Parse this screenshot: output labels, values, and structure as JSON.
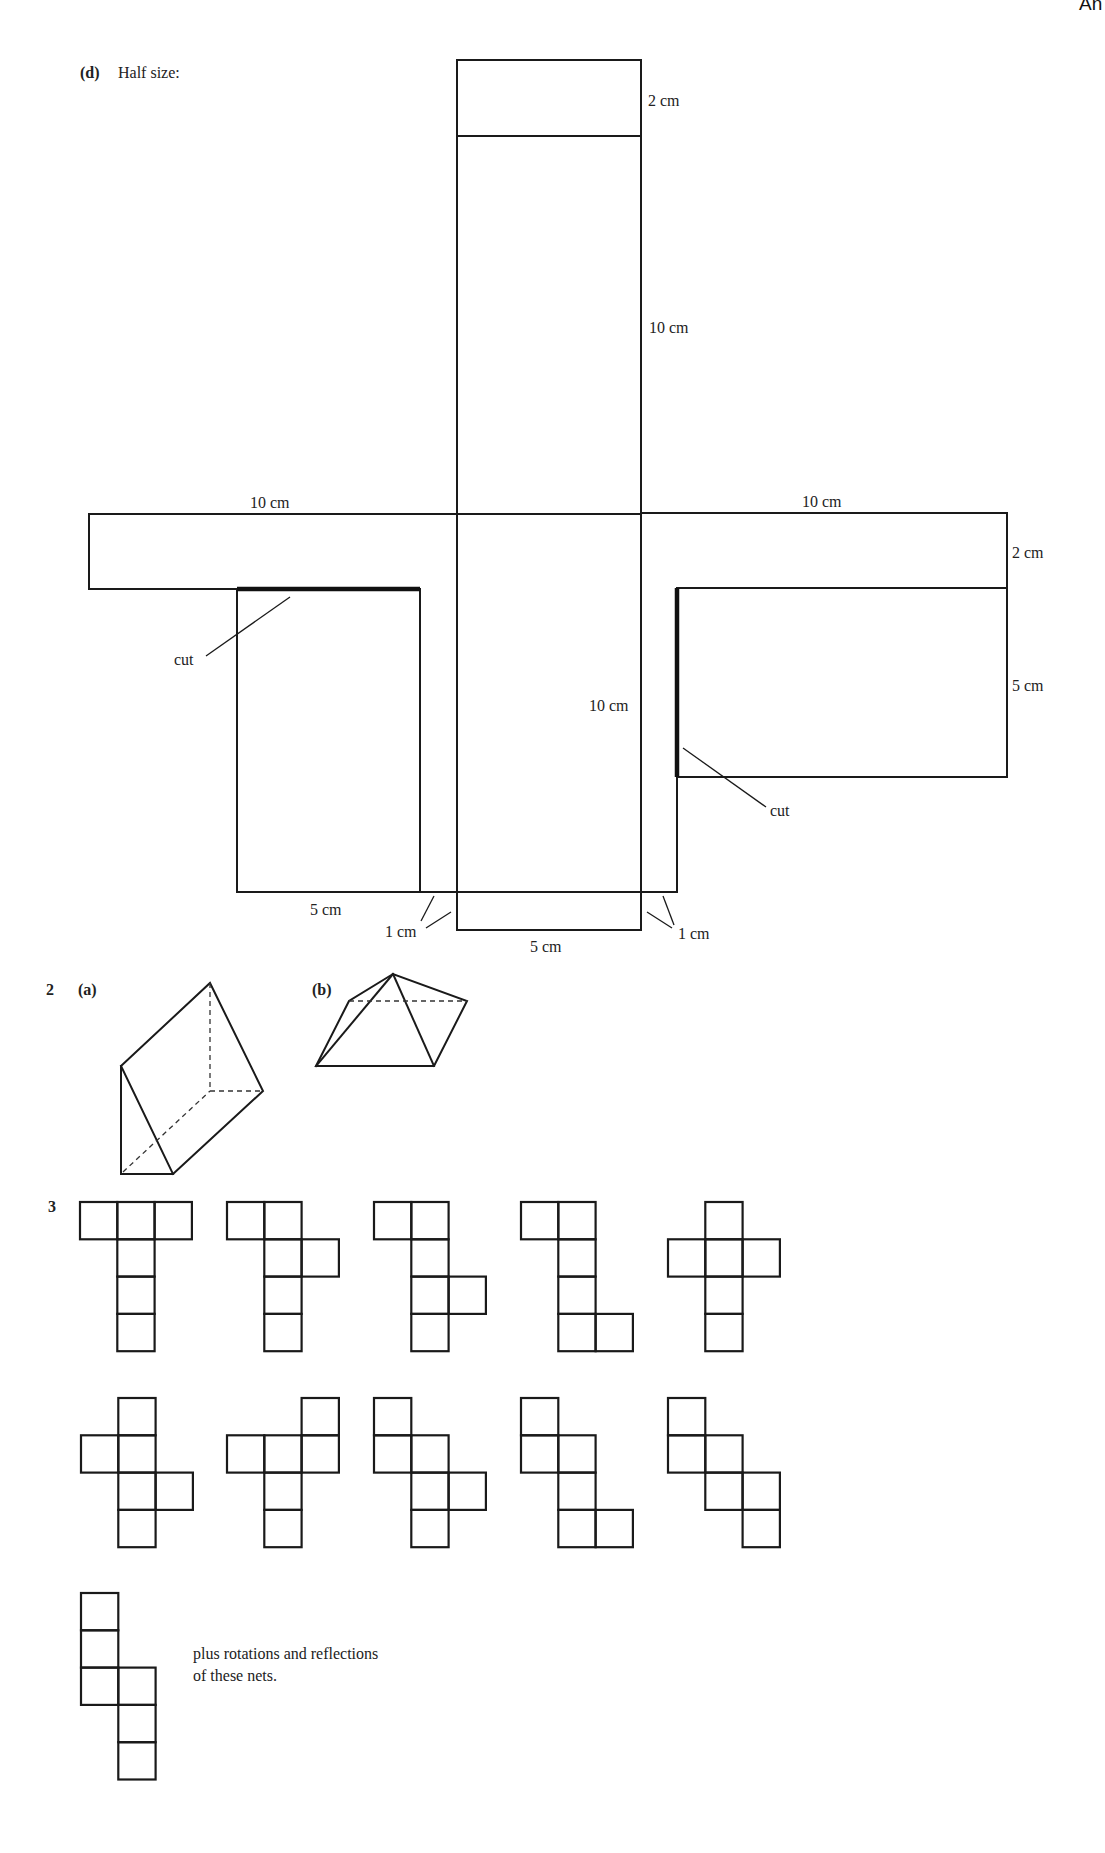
{
  "page": {
    "corner_header": "An"
  },
  "part_d": {
    "label": "(d)",
    "caption": "Half size:",
    "labels": [
      {
        "text": "2 cm",
        "x": 648,
        "y": 106
      },
      {
        "text": "10 cm",
        "x": 649,
        "y": 333
      },
      {
        "text": "10 cm",
        "x": 250,
        "y": 508
      },
      {
        "text": "10 cm",
        "x": 802,
        "y": 507
      },
      {
        "text": "2 cm",
        "x": 1012,
        "y": 558
      },
      {
        "text": "5 cm",
        "x": 1012,
        "y": 691
      },
      {
        "text": "10 cm",
        "x": 589,
        "y": 711
      },
      {
        "text": "cut",
        "x": 174,
        "y": 665
      },
      {
        "text": "cut",
        "x": 770,
        "y": 816
      },
      {
        "text": "5 cm",
        "x": 310,
        "y": 915
      },
      {
        "text": "1 cm",
        "x": 385,
        "y": 937
      },
      {
        "text": "1 cm",
        "x": 678,
        "y": 939
      },
      {
        "text": "5 cm",
        "x": 530,
        "y": 952
      }
    ]
  },
  "q2": {
    "number": "2",
    "part_a": "(a)",
    "part_b": "(b)"
  },
  "q3": {
    "number": "3",
    "cell_size": 37.3,
    "nets": [
      {
        "x": 80,
        "y": 1202,
        "cells": [
          [
            0,
            0
          ],
          [
            0,
            1
          ],
          [
            0,
            2
          ],
          [
            1,
            1
          ],
          [
            2,
            1
          ],
          [
            3,
            1
          ]
        ]
      },
      {
        "x": 227,
        "y": 1202,
        "cells": [
          [
            0,
            0
          ],
          [
            0,
            1
          ],
          [
            1,
            1
          ],
          [
            1,
            2
          ],
          [
            2,
            1
          ],
          [
            3,
            1
          ]
        ]
      },
      {
        "x": 374,
        "y": 1202,
        "cells": [
          [
            0,
            0
          ],
          [
            0,
            1
          ],
          [
            1,
            1
          ],
          [
            2,
            1
          ],
          [
            2,
            2
          ],
          [
            3,
            1
          ]
        ]
      },
      {
        "x": 521,
        "y": 1202,
        "cells": [
          [
            0,
            0
          ],
          [
            0,
            1
          ],
          [
            1,
            1
          ],
          [
            2,
            1
          ],
          [
            3,
            1
          ],
          [
            3,
            2
          ]
        ]
      },
      {
        "x": 668,
        "y": 1202,
        "cells": [
          [
            0,
            1
          ],
          [
            1,
            0
          ],
          [
            1,
            1
          ],
          [
            1,
            2
          ],
          [
            2,
            1
          ],
          [
            3,
            1
          ]
        ]
      },
      {
        "x": 81,
        "y": 1398,
        "cells": [
          [
            0,
            1
          ],
          [
            1,
            0
          ],
          [
            1,
            1
          ],
          [
            2,
            1
          ],
          [
            2,
            2
          ],
          [
            3,
            1
          ]
        ]
      },
      {
        "x": 227,
        "y": 1398,
        "cells": [
          [
            0,
            2
          ],
          [
            1,
            0
          ],
          [
            1,
            1
          ],
          [
            1,
            2
          ],
          [
            2,
            1
          ],
          [
            3,
            1
          ]
        ]
      },
      {
        "x": 374,
        "y": 1398,
        "cells": [
          [
            0,
            0
          ],
          [
            1,
            0
          ],
          [
            1,
            1
          ],
          [
            2,
            1
          ],
          [
            2,
            2
          ],
          [
            3,
            1
          ]
        ]
      },
      {
        "x": 521,
        "y": 1398,
        "cells": [
          [
            0,
            0
          ],
          [
            1,
            0
          ],
          [
            1,
            1
          ],
          [
            2,
            1
          ],
          [
            3,
            1
          ],
          [
            3,
            2
          ]
        ]
      },
      {
        "x": 668,
        "y": 1398,
        "cells": [
          [
            0,
            0
          ],
          [
            1,
            0
          ],
          [
            1,
            1
          ],
          [
            2,
            1
          ],
          [
            2,
            2
          ],
          [
            3,
            2
          ]
        ]
      },
      {
        "x": 81,
        "y": 1593,
        "cells": [
          [
            0,
            0
          ],
          [
            1,
            0
          ],
          [
            2,
            0
          ],
          [
            2,
            1
          ],
          [
            3,
            1
          ],
          [
            4,
            1
          ]
        ]
      }
    ],
    "note_line1": "plus rotations and reflections",
    "note_line2": "of these nets."
  }
}
